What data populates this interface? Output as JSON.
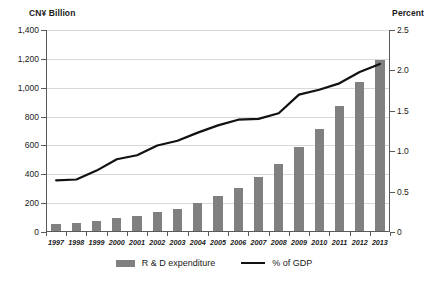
{
  "axes": {
    "left_title": "CN¥ Billion",
    "right_title": "Percent",
    "left_ticks": [
      "1,400",
      "1,200",
      "1,000",
      "800",
      "600",
      "400",
      "200",
      "0"
    ],
    "right_ticks": [
      "2.5",
      "2.0",
      "1.5",
      "1.0",
      "0.5",
      "0"
    ]
  },
  "legend": {
    "bar_label": "R & D expenditure",
    "line_label": "% of GDP"
  },
  "colors": {
    "bar": "#808080",
    "line": "#111111",
    "grid": "#d8d8d8",
    "axis": "#5a5a5a"
  },
  "chart_data": {
    "type": "bar",
    "title": "",
    "xlabel": "",
    "ylabel": "CN¥ Billion",
    "y2label": "Percent",
    "ylim": [
      0,
      1400
    ],
    "y2lim": [
      0,
      2.5
    ],
    "grid": true,
    "legend_position": "bottom",
    "categories": [
      "1997",
      "1998",
      "1999",
      "2000",
      "2001",
      "2002",
      "2003",
      "2004",
      "2005",
      "2006",
      "2007",
      "2008",
      "2009",
      "2010",
      "2011",
      "2012",
      "2013"
    ],
    "series": [
      {
        "name": "R & D expenditure",
        "type": "bar",
        "axis": "left",
        "unit": "CN¥ Billion",
        "values": [
          51,
          53,
          66,
          90,
          104,
          129,
          154,
          197,
          245,
          300,
          371,
          462,
          580,
          706,
          869,
          1030,
          1185
        ]
      },
      {
        "name": "% of GDP",
        "type": "line",
        "axis": "right",
        "unit": "Percent",
        "values": [
          0.64,
          0.65,
          0.76,
          0.9,
          0.95,
          1.07,
          1.13,
          1.23,
          1.32,
          1.39,
          1.4,
          1.47,
          1.7,
          1.76,
          1.84,
          1.98,
          2.08
        ]
      }
    ]
  }
}
